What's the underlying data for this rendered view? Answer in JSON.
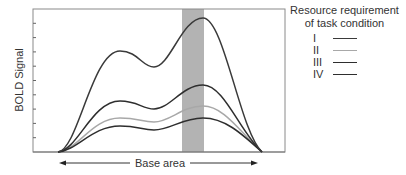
{
  "chart_data": {
    "type": "line",
    "title": "",
    "xlabel": "Base area",
    "ylabel": "BOLD Signal",
    "legend": {
      "title_line1": "Resource requirement",
      "title_line2": "of task condition",
      "position": "right"
    },
    "highlight_band": {
      "x_start": 182,
      "x_end": 204,
      "color": "#b3b3b3"
    },
    "y_ticks": 9,
    "grid": false,
    "series": [
      {
        "name": "I",
        "color": "#3a3a3a",
        "first_peak": 51,
        "trough": 67,
        "second_peak": 18
      },
      {
        "name": "II",
        "color": "#a8a8a8",
        "first_peak": 118,
        "trough": 122,
        "second_peak": 106
      },
      {
        "name": "III",
        "color": "#2e2e2e",
        "first_peak": 101,
        "trough": 109,
        "second_peak": 85
      },
      {
        "name": "IV",
        "color": "#2e2e2e",
        "first_peak": 126,
        "trough": 130,
        "second_peak": 118
      }
    ],
    "note": "Values are pixel y-positions (lower = higher signal); curves rise from baseline at x=58, peak near x=120, dip near x=153, peak again near x=203, and return to baseline at x=262."
  }
}
